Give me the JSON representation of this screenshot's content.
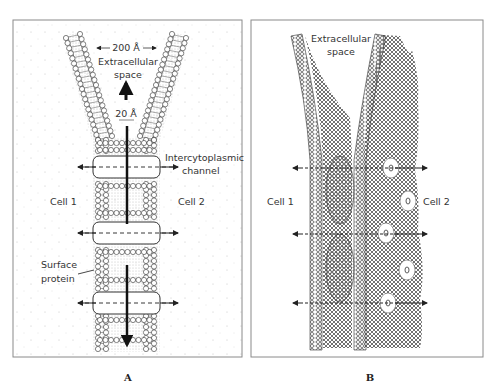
{
  "figure": {
    "panel_a": {
      "caption": "A",
      "labels": {
        "width_top": "200 Å",
        "extracellular": "Extracellular",
        "space": "space",
        "width_gap": "20 Å",
        "channel_line1": "Intercytoplasmic",
        "channel_line2": "channel",
        "cell1": "Cell 1",
        "cell2": "Cell 2",
        "surface_line1": "Surface",
        "surface_line2": "protein"
      }
    },
    "panel_b": {
      "caption": "B",
      "labels": {
        "extracellular": "Extracellular",
        "space": "space",
        "cell1": "Cell 1",
        "cell2": "Cell 2"
      }
    },
    "colors": {
      "ink": "#2a2a2a",
      "border": "#8a8a8a",
      "stipple": "#9a9a9a"
    }
  }
}
